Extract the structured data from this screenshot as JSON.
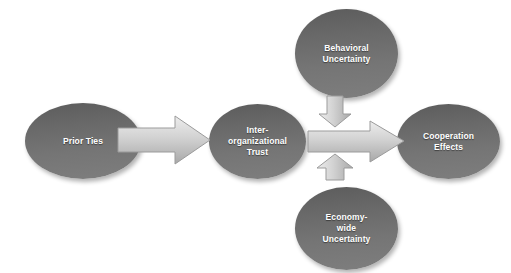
{
  "diagram": {
    "type": "flow-diagram",
    "background_color": "#ffffff",
    "node_fill_top": "#5c5c5c",
    "node_fill_bottom": "#7e7e7e",
    "node_text_color": "#ffffff",
    "arrow_fill_light": "#e2e2e2",
    "arrow_fill_dark": "#b0b0b0",
    "arrow_stroke": "#9a9a9a",
    "nodes": [
      {
        "id": "prior-ties",
        "label": "Prior Ties",
        "shape": "ellipse"
      },
      {
        "id": "inter-org-trust",
        "label": "Inter-\norganizational\nTrust",
        "shape": "ellipse"
      },
      {
        "id": "behavioral",
        "label": "Behavioral\nUncertainty",
        "shape": "ellipse"
      },
      {
        "id": "economy-wide",
        "label": "Economy-\nwide\nUncertainty",
        "shape": "ellipse"
      },
      {
        "id": "cooperation",
        "label": "Cooperation\nEffects",
        "shape": "ellipse"
      }
    ],
    "arrows": [
      {
        "id": "prior-to-trust",
        "from": "prior-ties",
        "to": "inter-org-trust",
        "direction": "right",
        "label": ""
      },
      {
        "id": "behavioral-down",
        "from": "behavioral",
        "to": "trust-to-coop",
        "direction": "down",
        "label": ""
      },
      {
        "id": "economy-up",
        "from": "economy-wide",
        "to": "trust-to-coop",
        "direction": "up",
        "label": ""
      },
      {
        "id": "trust-to-coop",
        "from": "inter-org-trust",
        "to": "cooperation",
        "direction": "right",
        "label": ""
      }
    ]
  }
}
